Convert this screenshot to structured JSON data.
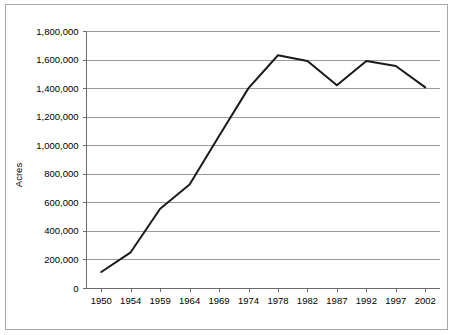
{
  "chart_data": {
    "type": "line",
    "title": "",
    "subtitle": "",
    "xlabel": "",
    "ylabel": "Acres",
    "categories": [
      "1950",
      "1954",
      "1959",
      "1964",
      "1969",
      "1974",
      "1978",
      "1982",
      "1987",
      "1992",
      "1997",
      "2002"
    ],
    "series": [
      {
        "name": "Acres",
        "values": [
          112000,
          250000,
          555000,
          725000,
          1065000,
          1400000,
          1630000,
          1590000,
          1420000,
          1590000,
          1555000,
          1405000
        ]
      }
    ],
    "ylim": [
      0,
      1800000
    ],
    "ytick_values": [
      0,
      200000,
      400000,
      600000,
      800000,
      1000000,
      1200000,
      1400000,
      1600000,
      1800000
    ],
    "ytick_labels": [
      "0",
      "200,000",
      "400,000",
      "600,000",
      "800,000",
      "1,000,000",
      "1,200,000",
      "1,400,000",
      "1,600,000",
      "1,800,000"
    ],
    "grid": "horizontal",
    "legend": "none",
    "line_color": "#1a1a1a",
    "grid_color": "#9a9a9a",
    "axis_color": "#6b6b6b",
    "background_color": "#ffffff",
    "border_color": "#a8a8a8"
  }
}
